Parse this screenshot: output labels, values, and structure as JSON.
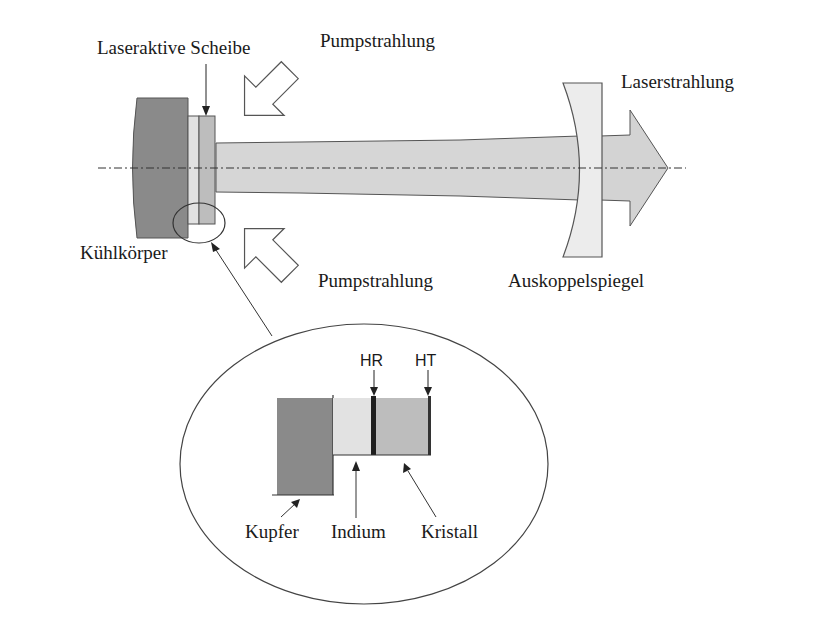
{
  "labels": {
    "disk": "Laseraktive Scheibe",
    "pump_top": "Pumpstrahlung",
    "pump_bottom": "Pumpstrahlung",
    "laser_out": "Laserstrahlung",
    "heatsink": "Kühlkörper",
    "output_mirror": "Auskoppelspiegel"
  },
  "detail": {
    "hr": "HR",
    "ht": "HT",
    "copper": "Kupfer",
    "indium": "Indium",
    "crystal": "Kristall"
  },
  "colors": {
    "heatsink": "#8a8a8a",
    "indium": "#e2e2e2",
    "crystal": "#bdbdbd",
    "beam": "#d6d6d6",
    "mirror": "#ececec",
    "coating": "#1e1e1e",
    "outline": "#4a4a4a"
  }
}
